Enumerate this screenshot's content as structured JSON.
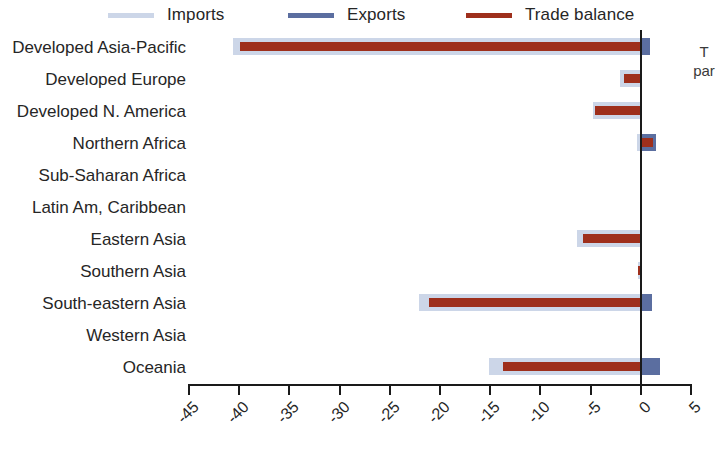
{
  "legend": {
    "items": [
      {
        "label": "Imports",
        "color": "#ccd6e8",
        "name": "legend-imports"
      },
      {
        "label": "Exports",
        "color": "#5b6ea0",
        "name": "legend-exports"
      },
      {
        "label": "Trade balance",
        "color": "#9e2f1c",
        "name": "legend-balance"
      }
    ]
  },
  "side_note": {
    "line1": "T",
    "line2": "par"
  },
  "chart_data": {
    "type": "bar",
    "orientation": "horizontal",
    "title": "",
    "xlabel": "",
    "ylabel": "",
    "xlim": [
      -45,
      5
    ],
    "xticks": [
      -45,
      -40,
      -35,
      -30,
      -25,
      -20,
      -15,
      -10,
      -5,
      0,
      5
    ],
    "xticklabels": [
      "-45",
      "-40",
      "-35",
      "-30",
      "-25",
      "-20",
      "-15",
      "-10",
      "-5",
      "0",
      "5"
    ],
    "grid": false,
    "legend_position": "top",
    "zero_line": true,
    "categories": [
      "Developed Asia-Pacific",
      "Developed Europe",
      "Developed N. America",
      "Northern Africa",
      "Sub-Saharan Africa",
      "Latin Am, Caribbean",
      "Eastern Asia",
      "Southern Asia",
      "South-eastern Asia",
      "Western Asia",
      "Oceania"
    ],
    "series": [
      {
        "name": "Imports",
        "color": "#ccd6e8",
        "values": [
          -40.5,
          -2.0,
          -4.7,
          -0.3,
          0.0,
          0.0,
          -6.3,
          -0.2,
          -22.0,
          0.0,
          -15.0
        ]
      },
      {
        "name": "Exports",
        "color": "#5b6ea0",
        "values": [
          1.0,
          0.0,
          0.0,
          1.6,
          0.0,
          0.0,
          0.2,
          0.0,
          1.2,
          0.0,
          2.0
        ]
      },
      {
        "name": "Trade balance",
        "color": "#9e2f1c",
        "values": [
          -39.8,
          -1.6,
          -4.5,
          1.3,
          0.0,
          0.0,
          -5.7,
          -0.2,
          -21.0,
          0.0,
          -13.6
        ]
      }
    ]
  }
}
